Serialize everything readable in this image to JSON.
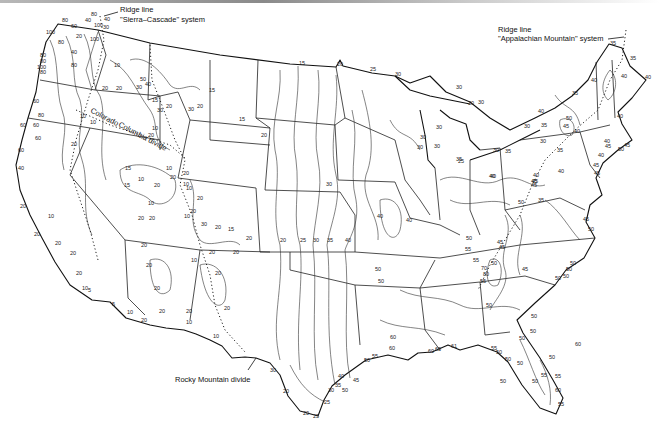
{
  "map": {
    "subject": "Continental United States isoline map",
    "annotations": {
      "sierra_cascade": {
        "line1": "Ridge line",
        "line2": "\"Sierra–Cascade\" system"
      },
      "appalachian": {
        "line1": "Ridge line",
        "line2": "\"Appalachian Mountain\" system"
      },
      "rocky_mountain": "Rocky Mountain divide",
      "colorado_divide": "Colorado",
      "columbia_divide": "Columbia divide"
    },
    "contour_labels": [
      {
        "v": "80",
        "x": 62,
        "y": 22
      },
      {
        "v": "60",
        "x": 71,
        "y": 28
      },
      {
        "v": "40",
        "x": 85,
        "y": 22
      },
      {
        "v": "100",
        "x": 94,
        "y": 27
      },
      {
        "v": "40",
        "x": 104,
        "y": 21
      },
      {
        "v": "80",
        "x": 91,
        "y": 16
      },
      {
        "v": "30",
        "x": 103,
        "y": 29
      },
      {
        "v": "100",
        "x": 46,
        "y": 34
      },
      {
        "v": "80",
        "x": 58,
        "y": 44
      },
      {
        "v": "20",
        "x": 76,
        "y": 38
      },
      {
        "v": "100",
        "x": 90,
        "y": 41
      },
      {
        "v": "80",
        "x": 40,
        "y": 57
      },
      {
        "v": "80",
        "x": 40,
        "y": 63
      },
      {
        "v": "100",
        "x": 37,
        "y": 69
      },
      {
        "v": "80",
        "x": 40,
        "y": 74
      },
      {
        "v": "40",
        "x": 71,
        "y": 54
      },
      {
        "v": "80",
        "x": 71,
        "y": 67
      },
      {
        "v": "10",
        "x": 114,
        "y": 67
      },
      {
        "v": "20",
        "x": 102,
        "y": 90
      },
      {
        "v": "20",
        "x": 116,
        "y": 90
      },
      {
        "v": "60",
        "x": 33,
        "y": 103
      },
      {
        "v": "80",
        "x": 38,
        "y": 117
      },
      {
        "v": "60",
        "x": 33,
        "y": 127
      },
      {
        "v": "50",
        "x": 140,
        "y": 81
      },
      {
        "v": "40",
        "x": 145,
        "y": 86
      },
      {
        "v": "30",
        "x": 136,
        "y": 89
      },
      {
        "v": "15",
        "x": 152,
        "y": 102
      },
      {
        "v": "30",
        "x": 157,
        "y": 112
      },
      {
        "v": "20",
        "x": 166,
        "y": 108
      },
      {
        "v": "10",
        "x": 80,
        "y": 118
      },
      {
        "v": "10",
        "x": 90,
        "y": 124
      },
      {
        "v": "20",
        "x": 148,
        "y": 137
      },
      {
        "v": "10",
        "x": 152,
        "y": 130
      },
      {
        "v": "15",
        "x": 209,
        "y": 92
      },
      {
        "v": "15",
        "x": 239,
        "y": 121
      },
      {
        "v": "30",
        "x": 188,
        "y": 111
      },
      {
        "v": "20",
        "x": 197,
        "y": 108
      },
      {
        "v": "60",
        "x": 20,
        "y": 127
      },
      {
        "v": "60",
        "x": 35,
        "y": 140
      },
      {
        "v": "60",
        "x": 18,
        "y": 152
      },
      {
        "v": "40",
        "x": 18,
        "y": 170
      },
      {
        "v": "20",
        "x": 71,
        "y": 146
      },
      {
        "v": "15",
        "x": 125,
        "y": 170
      },
      {
        "v": "15",
        "x": 124,
        "y": 187
      },
      {
        "v": "10",
        "x": 138,
        "y": 181
      },
      {
        "v": "20",
        "x": 154,
        "y": 187
      },
      {
        "v": "20",
        "x": 170,
        "y": 179
      },
      {
        "v": "10",
        "x": 183,
        "y": 186
      },
      {
        "v": "10",
        "x": 148,
        "y": 205
      },
      {
        "v": "20",
        "x": 138,
        "y": 220
      },
      {
        "v": "20",
        "x": 149,
        "y": 220
      },
      {
        "v": "20",
        "x": 20,
        "y": 208
      },
      {
        "v": "10",
        "x": 48,
        "y": 218
      },
      {
        "v": "20",
        "x": 34,
        "y": 236
      },
      {
        "v": "20",
        "x": 55,
        "y": 245
      },
      {
        "v": "20",
        "x": 70,
        "y": 255
      },
      {
        "v": "20",
        "x": 76,
        "y": 275
      },
      {
        "v": "10",
        "x": 82,
        "y": 290
      },
      {
        "v": "5",
        "x": 88,
        "y": 292
      },
      {
        "v": "10",
        "x": 166,
        "y": 170
      },
      {
        "v": "20",
        "x": 183,
        "y": 175
      },
      {
        "v": "10",
        "x": 186,
        "y": 190
      },
      {
        "v": "20",
        "x": 190,
        "y": 213
      },
      {
        "v": "20",
        "x": 197,
        "y": 200
      },
      {
        "v": "10",
        "x": 184,
        "y": 218
      },
      {
        "v": "15",
        "x": 228,
        "y": 231
      },
      {
        "v": "20",
        "x": 246,
        "y": 240
      },
      {
        "v": "30",
        "x": 201,
        "y": 226
      },
      {
        "v": "20",
        "x": 215,
        "y": 229
      },
      {
        "v": "20",
        "x": 280,
        "y": 242
      },
      {
        "v": "25",
        "x": 300,
        "y": 242
      },
      {
        "v": "30",
        "x": 313,
        "y": 242
      },
      {
        "v": "35",
        "x": 327,
        "y": 242
      },
      {
        "v": "40",
        "x": 345,
        "y": 242
      },
      {
        "v": "20",
        "x": 141,
        "y": 247
      },
      {
        "v": "20",
        "x": 146,
        "y": 267
      },
      {
        "v": "20",
        "x": 154,
        "y": 290
      },
      {
        "v": "20",
        "x": 159,
        "y": 313
      },
      {
        "v": "20",
        "x": 186,
        "y": 313
      },
      {
        "v": "10",
        "x": 191,
        "y": 262
      },
      {
        "v": "20",
        "x": 209,
        "y": 254
      },
      {
        "v": "20",
        "x": 233,
        "y": 254
      },
      {
        "v": "20",
        "x": 215,
        "y": 275
      },
      {
        "v": "20",
        "x": 224,
        "y": 310
      },
      {
        "v": "10",
        "x": 186,
        "y": 324
      },
      {
        "v": "5",
        "x": 112,
        "y": 306
      },
      {
        "v": "10",
        "x": 127,
        "y": 314
      },
      {
        "v": "20",
        "x": 141,
        "y": 322
      },
      {
        "v": "10",
        "x": 213,
        "y": 338
      },
      {
        "v": "15",
        "x": 299,
        "y": 65
      },
      {
        "v": "20",
        "x": 337,
        "y": 66
      },
      {
        "v": "25",
        "x": 370,
        "y": 71
      },
      {
        "v": "30",
        "x": 395,
        "y": 76
      },
      {
        "v": "30",
        "x": 456,
        "y": 89
      },
      {
        "v": "30",
        "x": 468,
        "y": 105
      },
      {
        "v": "20",
        "x": 261,
        "y": 137
      },
      {
        "v": "30",
        "x": 326,
        "y": 186
      },
      {
        "v": "30",
        "x": 420,
        "y": 139
      },
      {
        "v": "30",
        "x": 417,
        "y": 149
      },
      {
        "v": "30",
        "x": 434,
        "y": 148
      },
      {
        "v": "30",
        "x": 436,
        "y": 129
      },
      {
        "v": "30",
        "x": 478,
        "y": 104
      },
      {
        "v": "30",
        "x": 493,
        "y": 152
      },
      {
        "v": "35",
        "x": 505,
        "y": 153
      },
      {
        "v": "25",
        "x": 458,
        "y": 163
      },
      {
        "v": "40",
        "x": 406,
        "y": 222
      },
      {
        "v": "40",
        "x": 490,
        "y": 178
      },
      {
        "v": "45",
        "x": 532,
        "y": 183
      },
      {
        "v": "40",
        "x": 533,
        "y": 177
      },
      {
        "v": "40",
        "x": 377,
        "y": 218
      },
      {
        "v": "50",
        "x": 375,
        "y": 271
      },
      {
        "v": "50",
        "x": 378,
        "y": 283
      },
      {
        "v": "35",
        "x": 610,
        "y": 45
      },
      {
        "v": "35",
        "x": 630,
        "y": 60
      },
      {
        "v": "40",
        "x": 621,
        "y": 78
      },
      {
        "v": "40",
        "x": 645,
        "y": 79
      },
      {
        "v": "40",
        "x": 591,
        "y": 82
      },
      {
        "v": "35",
        "x": 572,
        "y": 95
      },
      {
        "v": "40",
        "x": 538,
        "y": 113
      },
      {
        "v": "35",
        "x": 541,
        "y": 127
      },
      {
        "v": "30",
        "x": 524,
        "y": 128
      },
      {
        "v": "50",
        "x": 566,
        "y": 120
      },
      {
        "v": "45",
        "x": 563,
        "y": 128
      },
      {
        "v": "40",
        "x": 574,
        "y": 133
      },
      {
        "v": "40",
        "x": 617,
        "y": 118
      },
      {
        "v": "45",
        "x": 605,
        "y": 148
      },
      {
        "v": "40",
        "x": 604,
        "y": 143
      },
      {
        "v": "50",
        "x": 618,
        "y": 151
      },
      {
        "v": "45",
        "x": 624,
        "y": 147
      },
      {
        "v": "40",
        "x": 598,
        "y": 157
      },
      {
        "v": "30",
        "x": 540,
        "y": 143
      },
      {
        "v": "35",
        "x": 557,
        "y": 152
      },
      {
        "v": "35",
        "x": 456,
        "y": 161
      },
      {
        "v": "45",
        "x": 593,
        "y": 167
      },
      {
        "v": "45",
        "x": 594,
        "y": 175
      },
      {
        "v": "40",
        "x": 489,
        "y": 178
      },
      {
        "v": "40",
        "x": 558,
        "y": 173
      },
      {
        "v": "45",
        "x": 531,
        "y": 183
      },
      {
        "v": "45",
        "x": 531,
        "y": 187
      },
      {
        "v": "50",
        "x": 518,
        "y": 204
      },
      {
        "v": "35",
        "x": 538,
        "y": 202
      },
      {
        "v": "45",
        "x": 583,
        "y": 221
      },
      {
        "v": "50",
        "x": 588,
        "y": 231
      },
      {
        "v": "50",
        "x": 466,
        "y": 240
      },
      {
        "v": "55",
        "x": 465,
        "y": 251
      },
      {
        "v": "45",
        "x": 497,
        "y": 244
      },
      {
        "v": "45",
        "x": 499,
        "y": 249
      },
      {
        "v": "50",
        "x": 491,
        "y": 265
      },
      {
        "v": "70",
        "x": 481,
        "y": 270
      },
      {
        "v": "80",
        "x": 483,
        "y": 276
      },
      {
        "v": "55",
        "x": 480,
        "y": 283
      },
      {
        "v": "45",
        "x": 522,
        "y": 271
      },
      {
        "v": "50",
        "x": 566,
        "y": 271
      },
      {
        "v": "50",
        "x": 555,
        "y": 280
      },
      {
        "v": "55",
        "x": 473,
        "y": 262
      },
      {
        "v": "50",
        "x": 486,
        "y": 307
      },
      {
        "v": "50",
        "x": 531,
        "y": 318
      },
      {
        "v": "50",
        "x": 530,
        "y": 333
      },
      {
        "v": "50",
        "x": 519,
        "y": 340
      },
      {
        "v": "50",
        "x": 549,
        "y": 359
      },
      {
        "v": "55",
        "x": 555,
        "y": 378
      },
      {
        "v": "50",
        "x": 532,
        "y": 383
      },
      {
        "v": "60",
        "x": 555,
        "y": 392
      },
      {
        "v": "55",
        "x": 558,
        "y": 406
      },
      {
        "v": "55",
        "x": 491,
        "y": 350
      },
      {
        "v": "50",
        "x": 496,
        "y": 354
      },
      {
        "v": "50",
        "x": 505,
        "y": 361
      },
      {
        "v": "50",
        "x": 517,
        "y": 365
      },
      {
        "v": "50",
        "x": 500,
        "y": 383
      },
      {
        "v": "60",
        "x": 389,
        "y": 350
      },
      {
        "v": "60",
        "x": 428,
        "y": 353
      },
      {
        "v": "65",
        "x": 435,
        "y": 351
      },
      {
        "v": "61",
        "x": 451,
        "y": 348
      },
      {
        "v": "60",
        "x": 390,
        "y": 339
      },
      {
        "v": "55",
        "x": 372,
        "y": 358
      },
      {
        "v": "50",
        "x": 364,
        "y": 362
      },
      {
        "v": "55",
        "x": 541,
        "y": 377
      },
      {
        "v": "60",
        "x": 575,
        "y": 346
      },
      {
        "v": "45",
        "x": 353,
        "y": 382
      },
      {
        "v": "50",
        "x": 342,
        "y": 392
      },
      {
        "v": "40",
        "x": 338,
        "y": 378
      },
      {
        "v": "35",
        "x": 335,
        "y": 387
      },
      {
        "v": "30",
        "x": 328,
        "y": 392
      },
      {
        "v": "30",
        "x": 270,
        "y": 372
      },
      {
        "v": "20",
        "x": 283,
        "y": 393
      },
      {
        "v": "25",
        "x": 324,
        "y": 404
      },
      {
        "v": "20",
        "x": 303,
        "y": 415
      },
      {
        "v": "25",
        "x": 313,
        "y": 418
      },
      {
        "v": "50",
        "x": 563,
        "y": 278
      },
      {
        "v": "50",
        "x": 570,
        "y": 265
      }
    ]
  },
  "colors": {
    "ink": "#111111",
    "contour": "#333333",
    "background": "#ffffff"
  }
}
